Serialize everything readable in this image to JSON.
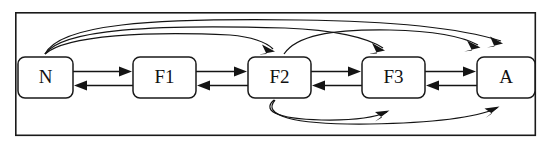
{
  "figure": {
    "frame": {
      "x": 15,
      "y": 12,
      "width": 521,
      "height": 124
    },
    "canvas": {
      "width": 550,
      "height": 149
    },
    "colors": {
      "stroke": "#141414",
      "node_fill": "#ffffff",
      "background": "#ffffff",
      "frame_stroke": "#1a1a1a"
    }
  },
  "nodes": [
    {
      "id": "N",
      "label": "N",
      "x": 18,
      "y": 57,
      "width": 55,
      "height": 41
    },
    {
      "id": "F1",
      "label": "F1",
      "x": 133,
      "y": 57,
      "width": 63,
      "height": 41
    },
    {
      "id": "F2",
      "label": "F2",
      "x": 248,
      "y": 57,
      "width": 63,
      "height": 41
    },
    {
      "id": "F3",
      "label": "F3",
      "x": 362,
      "y": 57,
      "width": 63,
      "height": 41
    },
    {
      "id": "A",
      "label": "A",
      "x": 477,
      "y": 57,
      "width": 58,
      "height": 41
    }
  ],
  "edges": [
    {
      "from": "N",
      "to": "F1",
      "kind": "straight",
      "direction": "forward"
    },
    {
      "from": "F1",
      "to": "N",
      "kind": "straight",
      "direction": "backward"
    },
    {
      "from": "F1",
      "to": "F2",
      "kind": "straight",
      "direction": "forward"
    },
    {
      "from": "F2",
      "to": "F1",
      "kind": "straight",
      "direction": "backward"
    },
    {
      "from": "F2",
      "to": "F3",
      "kind": "straight",
      "direction": "forward"
    },
    {
      "from": "F3",
      "to": "F2",
      "kind": "straight",
      "direction": "backward"
    },
    {
      "from": "F3",
      "to": "A",
      "kind": "straight",
      "direction": "forward"
    },
    {
      "from": "A",
      "to": "F3",
      "kind": "straight",
      "direction": "backward"
    },
    {
      "from": "N",
      "to": "F2",
      "kind": "curve-top"
    },
    {
      "from": "N",
      "to": "F3",
      "kind": "curve-top"
    },
    {
      "from": "N",
      "to": "A",
      "kind": "curve-top"
    },
    {
      "from": "F2",
      "to": "A",
      "kind": "curve-top"
    },
    {
      "from": "F2",
      "to": "F3",
      "kind": "curve-bottom"
    },
    {
      "from": "F2",
      "to": "A",
      "kind": "curve-bottom"
    }
  ]
}
